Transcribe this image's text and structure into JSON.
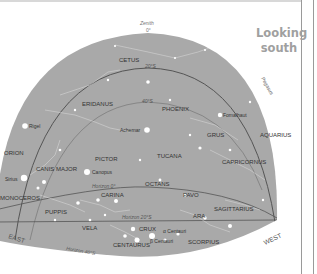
{
  "title": {
    "line1": "Looking",
    "line2": "south"
  },
  "colors": {
    "sky": "#a9a9a9",
    "stars": "#ffffff",
    "labels": "#333333",
    "lines": "#555555"
  },
  "zenith": {
    "label": "Zenith",
    "value": "0°"
  },
  "directions": {
    "east": "EAST",
    "west": "WEST"
  },
  "latitude_lines": {
    "lat20n": "20°S",
    "lat40s": "40°S",
    "horizon0": "Horizon 0°",
    "horizon20": "Horizon 20°S",
    "horizon40": "Horizon 40°S"
  },
  "constellations": {
    "cetus": "CETUS",
    "eridanus": "ERIDANUS",
    "phoenix": "PHOENIX",
    "grus": "GRUS",
    "aquarius": "AQUARIUS",
    "capricornus": "CAPRICORNUS",
    "tucana": "TUCANA",
    "pictor": "PICTOR",
    "orion": "ORION",
    "canis_major": "CANIS MAJOR",
    "monoceros": "MONOCEROS",
    "puppis": "PUPPIS",
    "carina": "CARINA",
    "octans": "OCTANS",
    "pavo": "PAVO",
    "sagittarius": "SAGITTARIUS",
    "ara": "ARA",
    "vela": "VELA",
    "crux": "CRUX",
    "centaurus": "CENTAURUS",
    "scorpius": "SCORPIUS",
    "pegasus": "Pegasus"
  },
  "stars": {
    "rigel": "Rigel",
    "achernar": "Achernar",
    "fomalhaut": "Fomalhaut",
    "canopus": "Canopus",
    "sirius": "Sirius",
    "alpha_centauri": "α Centauri",
    "beta_centauri": "β Centauri"
  }
}
